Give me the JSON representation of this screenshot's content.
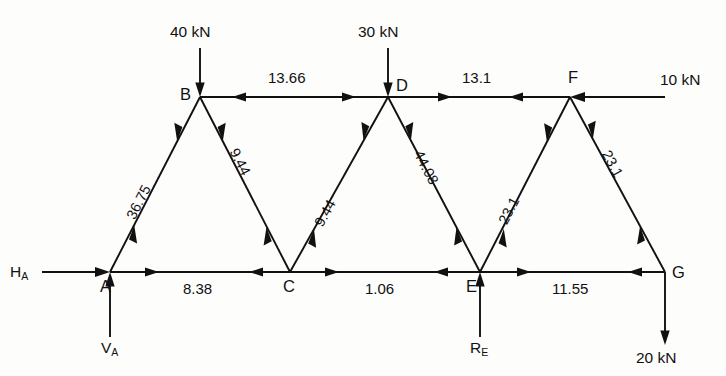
{
  "diagram": {
    "type": "truss-force-diagram",
    "units": "kN",
    "ink_color": "#111111",
    "background_color": "#fdfdfc"
  },
  "nodes": [
    {
      "id": "A",
      "label": "A",
      "x": 110,
      "y": 272
    },
    {
      "id": "B",
      "label": "B",
      "x": 200,
      "y": 97
    },
    {
      "id": "C",
      "label": "C",
      "x": 290,
      "y": 272
    },
    {
      "id": "D",
      "label": "D",
      "x": 388,
      "y": 97
    },
    {
      "id": "E",
      "label": "E",
      "x": 480,
      "y": 272
    },
    {
      "id": "F",
      "label": "F",
      "x": 570,
      "y": 97
    },
    {
      "id": "G",
      "label": "G",
      "x": 665,
      "y": 272
    }
  ],
  "members": [
    {
      "id": "BD",
      "label": "13.66",
      "from": "B",
      "to": "D",
      "sense": "compression",
      "chord": "top"
    },
    {
      "id": "DF",
      "label": "13.1",
      "from": "D",
      "to": "F",
      "sense": "compression",
      "chord": "top"
    },
    {
      "id": "AC",
      "label": "8.38",
      "from": "A",
      "to": "C",
      "sense": "tension",
      "chord": "bottom"
    },
    {
      "id": "CE",
      "label": "1.06",
      "from": "C",
      "to": "E",
      "sense": "tension",
      "chord": "bottom"
    },
    {
      "id": "EG",
      "label": "11.55",
      "from": "E",
      "to": "G",
      "sense": "tension",
      "chord": "bottom"
    },
    {
      "id": "AB",
      "label": "36.75",
      "from": "A",
      "to": "B",
      "sense": "tension",
      "chord": "diagonal"
    },
    {
      "id": "BC",
      "label": "9.44",
      "from": "B",
      "to": "C",
      "sense": "tension",
      "chord": "diagonal"
    },
    {
      "id": "CD",
      "label": "9.44",
      "from": "C",
      "to": "D",
      "sense": "tension",
      "chord": "diagonal"
    },
    {
      "id": "DE",
      "label": "44.08",
      "from": "D",
      "to": "E",
      "sense": "tension",
      "chord": "diagonal"
    },
    {
      "id": "EF",
      "label": "23.1",
      "from": "E",
      "to": "F",
      "sense": "tension",
      "chord": "diagonal"
    },
    {
      "id": "FG",
      "label": "23.1",
      "from": "F",
      "to": "G",
      "sense": "tension",
      "chord": "diagonal"
    }
  ],
  "loads": [
    {
      "id": "load-B",
      "label": "40 kN",
      "at": "B",
      "direction": "down"
    },
    {
      "id": "load-D",
      "label": "30 kN",
      "at": "D",
      "direction": "down"
    },
    {
      "id": "load-F",
      "label": "10 kN",
      "at": "F",
      "direction": "left"
    },
    {
      "id": "load-G",
      "label": "20 kN",
      "at": "G",
      "direction": "down"
    }
  ],
  "reactions": [
    {
      "id": "reaction-HA",
      "label": "H",
      "subscript": "A",
      "at": "A",
      "direction": "right"
    },
    {
      "id": "reaction-VA",
      "label": "V",
      "subscript": "A",
      "at": "A",
      "direction": "up"
    },
    {
      "id": "reaction-RE",
      "label": "R",
      "subscript": "E",
      "at": "E",
      "direction": "up"
    }
  ]
}
